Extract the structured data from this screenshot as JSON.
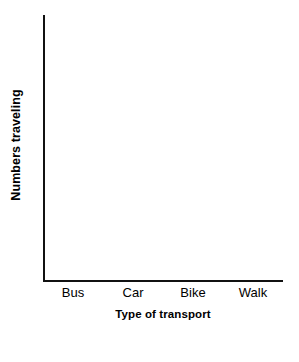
{
  "chart_data": {
    "type": "bar",
    "title": "",
    "subtitle": "",
    "xlabel": "Type of transport",
    "ylabel": "Numbers traveling",
    "categories": [
      "Bus",
      "Car",
      "Bike",
      "Walk"
    ],
    "values": [
      null,
      null,
      null,
      null
    ],
    "series": [
      {
        "name": "",
        "values": [
          null,
          null,
          null,
          null
        ]
      }
    ],
    "ylim": [
      null,
      null
    ],
    "xlim": [
      null,
      null
    ],
    "ytick_labels": [],
    "xtick_labels": [
      "Bus",
      "Car",
      "Bike",
      "Walk"
    ],
    "grid": false,
    "ticks": false,
    "legend": false,
    "legend_position": "none",
    "annotations": [],
    "note": "Blank worksheet axes - no bars drawn, no numeric scale marked"
  },
  "figure": {
    "axis_color": "#111111",
    "background_color": "#ffffff",
    "text_color": "#000000"
  }
}
